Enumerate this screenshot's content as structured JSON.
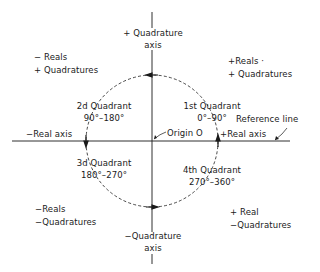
{
  "diagram": {
    "axes": {
      "positive_quadrature": [
        "+ Quadrature",
        "axis"
      ],
      "negative_quadrature": [
        "−Quadrature",
        "axis"
      ],
      "negative_real": "−Real axis",
      "positive_real": "+Real axis",
      "origin": "Origin O",
      "reference_line": "Reference line"
    },
    "quadrants": [
      {
        "name": "1st Quadrant",
        "range": "0°–90°",
        "signs": [
          "+Reals ·",
          "+ Quadratures"
        ]
      },
      {
        "name": "2d Quadrant",
        "range": "90°–180°",
        "signs": [
          "− Reals",
          "+ Quadratures"
        ]
      },
      {
        "name": "3d Quadrant",
        "range": "180°–270°",
        "signs": [
          "−Reals",
          "−Quadratures"
        ]
      },
      {
        "name": "4th Quadrant",
        "range": "270°–360°",
        "signs": [
          "+ Real",
          "−Quadratures"
        ]
      }
    ],
    "colors": {
      "ink": "#1a1a1a",
      "background": "#ffffff"
    }
  }
}
